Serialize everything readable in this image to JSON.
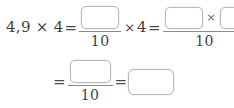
{
  "worksheet": {
    "type": "fill-in-the-blank-math-expression",
    "line1": {
      "lhs": "4,9 × 4",
      "equals_1": "=",
      "fraction_1": {
        "numerator_blank": "",
        "denominator": "10"
      },
      "times": "×",
      "multiplier": "4",
      "equals_2": "=",
      "fraction_2": {
        "numerator_blank_left": "",
        "numerator_operator": "×",
        "numerator_blank_right": "",
        "denominator": "10"
      }
    },
    "line2": {
      "equals_3": "=",
      "fraction_3": {
        "numerator_blank": "",
        "denominator": "10"
      },
      "equals_4": "=",
      "answer_blank": ""
    }
  },
  "style": {
    "text_color": "#3f3f3f",
    "rule_color": "#8a8a8a",
    "box_border_color": "#b9b9b9",
    "background": "#ffffff"
  }
}
